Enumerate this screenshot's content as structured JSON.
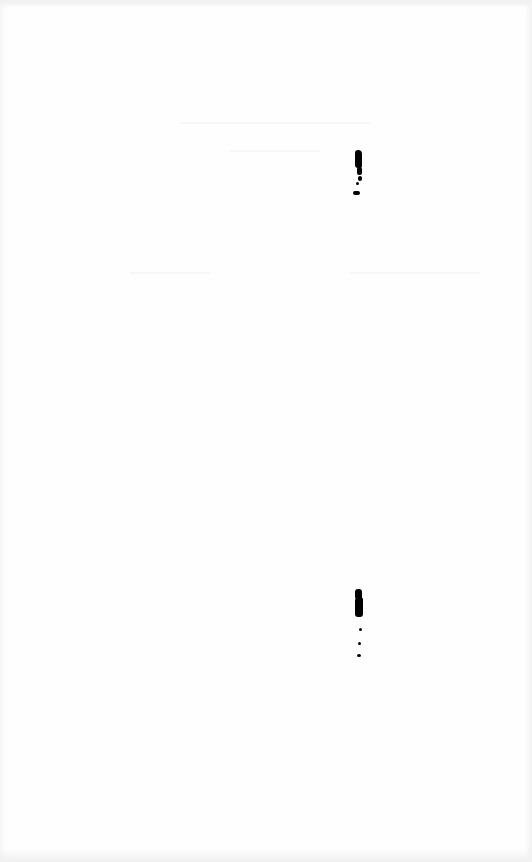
{
  "page": {
    "background": "#ffffff",
    "legible_text": []
  },
  "marks": [
    {
      "name": "ink-mark-upper",
      "x": 353,
      "y": 148,
      "height": 50
    },
    {
      "name": "ink-mark-lower",
      "x": 354,
      "y": 588,
      "height": 72
    }
  ]
}
